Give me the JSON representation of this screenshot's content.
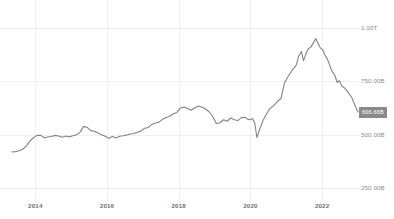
{
  "chart_data": {
    "type": "line",
    "title": "",
    "subtitle": "",
    "xlabel": "",
    "ylabel": "",
    "grid": true,
    "legend_position": "none",
    "line_color": "#838383",
    "grid_color": "#f0f0f0",
    "axis_label_color": "#8c8c8c",
    "badge_color": "#8a8a8a",
    "badge_text_color": "#ffffff",
    "y_ticks": [
      {
        "label": "1.00T",
        "value": 1000
      },
      {
        "label": "750.00B",
        "value": 750
      },
      {
        "label": "500.00B",
        "value": 500
      },
      {
        "label": "250.00B",
        "value": 250
      }
    ],
    "ylim": [
      195,
      1092
    ],
    "x_ticks": [
      {
        "label": "2014",
        "value": 2014.0
      },
      {
        "label": "2016",
        "value": 2016.0
      },
      {
        "label": "2018",
        "value": 2018.0
      },
      {
        "label": "2020",
        "value": 2020.0
      },
      {
        "label": "2022",
        "value": 2022.0
      }
    ],
    "xlim": [
      2013.35,
      2023.0
    ],
    "last_value_label": "606.66B",
    "last_value": 606.66,
    "series": [
      {
        "name": "Market Cap",
        "x": [
          2013.35,
          2013.45,
          2013.55,
          2013.65,
          2013.75,
          2013.85,
          2013.95,
          2014.05,
          2014.15,
          2014.25,
          2014.35,
          2014.45,
          2014.55,
          2014.65,
          2014.75,
          2014.85,
          2014.95,
          2015.05,
          2015.15,
          2015.25,
          2015.35,
          2015.45,
          2015.55,
          2015.65,
          2015.75,
          2015.85,
          2015.95,
          2016.05,
          2016.15,
          2016.25,
          2016.35,
          2016.45,
          2016.55,
          2016.65,
          2016.75,
          2016.85,
          2016.95,
          2017.05,
          2017.15,
          2017.25,
          2017.35,
          2017.45,
          2017.55,
          2017.65,
          2017.75,
          2017.85,
          2017.95,
          2018.05,
          2018.15,
          2018.25,
          2018.35,
          2018.45,
          2018.55,
          2018.65,
          2018.75,
          2018.85,
          2018.95,
          2019.05,
          2019.15,
          2019.25,
          2019.35,
          2019.45,
          2019.55,
          2019.65,
          2019.75,
          2019.85,
          2019.95,
          2020.05,
          2020.12,
          2020.18,
          2020.25,
          2020.35,
          2020.45,
          2020.55,
          2020.65,
          2020.75,
          2020.85,
          2020.95,
          2021.05,
          2021.15,
          2021.22,
          2021.28,
          2021.35,
          2021.42,
          2021.48,
          2021.55,
          2021.62,
          2021.68,
          2021.75,
          2021.82,
          2021.88,
          2021.95,
          2022.02,
          2022.08,
          2022.15,
          2022.22,
          2022.28,
          2022.35,
          2022.42,
          2022.48,
          2022.55,
          2022.62,
          2022.68,
          2022.75,
          2022.82,
          2022.88,
          2022.95,
          2023.0
        ],
        "y": [
          420,
          421,
          425,
          432,
          448,
          470,
          487,
          497,
          497,
          486,
          489,
          492,
          497,
          494,
          488,
          494,
          490,
          495,
          500,
          512,
          539,
          534,
          519,
          516,
          508,
          500,
          493,
          483,
          492,
          485,
          493,
          495,
          499,
          503,
          506,
          512,
          518,
          530,
          534,
          548,
          555,
          559,
          572,
          580,
          586,
          598,
          604,
          625,
          629,
          622,
          614,
          626,
          634,
          628,
          620,
          606,
          585,
          552,
          556,
          570,
          563,
          578,
          570,
          566,
          580,
          581,
          570,
          575,
          556,
          487,
          522,
          566,
          598,
          623,
          636,
          655,
          669,
          742,
          772,
          798,
          812,
          826,
          869,
          889,
          846,
          879,
          903,
          908,
          928,
          949,
          929,
          906,
          896,
          871,
          852,
          819,
          796,
          779,
          744,
          752,
          728,
          719,
          708,
          692,
          676,
          652,
          624,
          606
        ]
      }
    ]
  }
}
